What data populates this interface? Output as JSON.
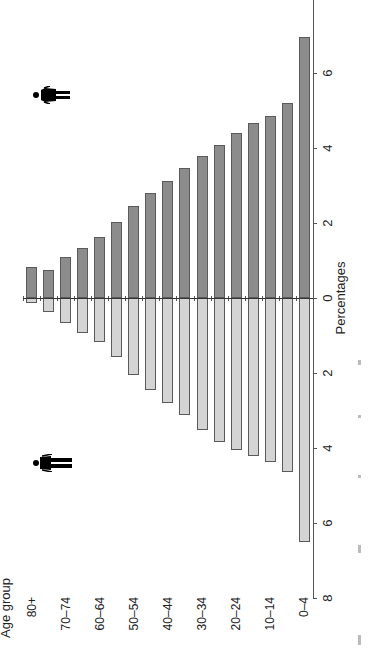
{
  "chart_data": {
    "type": "bar",
    "subtype": "population-pyramid",
    "orientation": "rotated-90-ccw",
    "title": "",
    "xlabel": "Percentages",
    "ylabel": "Age group",
    "categories": [
      "80+",
      "75–79",
      "70–74",
      "65–69",
      "60–64",
      "55–59",
      "50–54",
      "45–49",
      "40–44",
      "35–39",
      "30–34",
      "25–29",
      "20–24",
      "15–19",
      "10–14",
      "5–9",
      "0–4"
    ],
    "visible_category_labels": [
      "80+",
      "70–74",
      "60–64",
      "50–54",
      "40–44",
      "30–34",
      "20–24",
      "10–14",
      "0–4"
    ],
    "series": [
      {
        "name": "Female",
        "icon": "female-icon",
        "color": "#8c8c8c",
        "values": [
          0.84,
          0.74,
          1.09,
          1.34,
          1.63,
          2.02,
          2.46,
          2.81,
          3.11,
          3.46,
          3.78,
          4.09,
          4.41,
          4.68,
          4.86,
          5.2,
          6.95
        ]
      },
      {
        "name": "Male",
        "icon": "male-icon",
        "color": "#d4d4d4",
        "values": [
          0.12,
          0.38,
          0.67,
          0.92,
          1.18,
          1.58,
          2.04,
          2.46,
          2.79,
          3.13,
          3.53,
          3.83,
          4.04,
          4.22,
          4.36,
          4.64,
          6.5
        ]
      }
    ],
    "axis": {
      "female_ticks": [
        "0",
        "2",
        "4",
        "6"
      ],
      "male_ticks": [
        "2",
        "4",
        "6",
        "8"
      ],
      "range_female": [
        0,
        7.8
      ],
      "range_male": [
        0,
        8
      ]
    },
    "grid": false,
    "legend": "icons (female icon above dark bars, male icon below light bars)"
  },
  "labels": {
    "age_group": "Age group",
    "percentages": "Percentages"
  }
}
